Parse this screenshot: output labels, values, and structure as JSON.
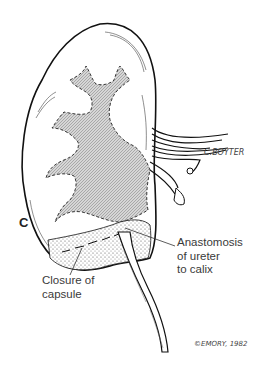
{
  "figure": {
    "panel_label": "C",
    "annotations": [
      {
        "id": "anastomosis",
        "text": "Anastomosis\nof ureter\nto calix"
      },
      {
        "id": "closure",
        "text": "Closure of\ncapsule"
      }
    ],
    "signatures": {
      "artist": "C.BOYTER",
      "copyright": "©EMORY, 1982"
    },
    "colors": {
      "line": "#1a1a1a",
      "collecting_system_fill": "#bdbdbd",
      "background": "#ffffff",
      "label_text": "#3a3a3a"
    }
  }
}
